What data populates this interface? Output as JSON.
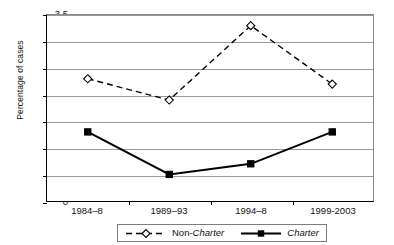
{
  "chart_data": {
    "type": "line",
    "title": "",
    "xlabel": "",
    "ylabel": "Percentage of cases",
    "categories": [
      "1984–8",
      "1989–93",
      "1994–8",
      "1999-2003"
    ],
    "ylim": [
      0,
      3.5
    ],
    "ytick_step": 0.5,
    "yticks": [
      "3.5",
      "3",
      "2.5",
      "2",
      "1.5",
      "1",
      "0.5",
      "0"
    ],
    "ytick_values": [
      3.5,
      3,
      2.5,
      2,
      1.5,
      1,
      0.5,
      0
    ],
    "grid": true,
    "legend_position": "bottom",
    "series": [
      {
        "name": "Non-Charter",
        "name_prefix": "Non-",
        "name_italic_part": "Charter",
        "values": [
          2.3,
          1.9,
          3.3,
          2.2
        ],
        "line_style": "dashed",
        "marker": "open-diamond",
        "color": "#000000"
      },
      {
        "name": "Charter",
        "name_prefix": "",
        "name_italic_part": "Charter",
        "values": [
          1.3,
          0.5,
          0.7,
          1.3
        ],
        "line_style": "solid",
        "marker": "filled-square",
        "color": "#000000"
      }
    ]
  },
  "axes": {
    "y_title": "Percentage of cases"
  },
  "legend": {
    "entries": [
      {
        "prefix": "Non-",
        "italic": "Charter"
      },
      {
        "prefix": "",
        "italic": "Charter"
      }
    ]
  },
  "colors": {
    "plot_border": "#8a8a8a",
    "axis": "#000000",
    "gridline": "#9a9a9a",
    "series": "#000000",
    "background": "#ffffff"
  }
}
